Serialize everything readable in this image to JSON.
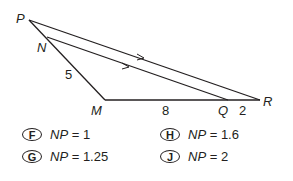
{
  "figure": {
    "vertices": {
      "P": {
        "label": "P"
      },
      "N": {
        "label": "N"
      },
      "M": {
        "label": "M"
      },
      "Q": {
        "label": "Q"
      },
      "R": {
        "label": "R"
      }
    },
    "segment_lengths": {
      "NM": "5",
      "MQ": "8",
      "QR": "2"
    },
    "parallel_marks": "NQ ∥ PR"
  },
  "choices": [
    {
      "letter": "F",
      "variable": "NP",
      "equals": "= 1"
    },
    {
      "letter": "G",
      "variable": "NP",
      "equals": "= 1.25"
    },
    {
      "letter": "H",
      "variable": "NP",
      "equals": "= 1.6"
    },
    {
      "letter": "J",
      "variable": "NP",
      "equals": "= 2"
    }
  ]
}
